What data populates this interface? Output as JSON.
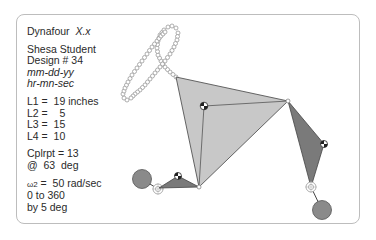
{
  "header": {
    "app_name": "Dynafour",
    "version": "X.x"
  },
  "student": {
    "name": "Shesa Student",
    "design": "Design # 34",
    "date": "mm-dd-yy",
    "time": "hr-mn-sec"
  },
  "links": {
    "l1": "L1 =  19 inches",
    "l2": "L2 =    5",
    "l3": "L3 =  15",
    "l4": "L4 =  10"
  },
  "coupler": {
    "point": "Cplrpt = 13",
    "angle": "@  63  deg"
  },
  "input": {
    "omega_symbol": "ω2",
    "omega": " =  50 rad/sec",
    "range": "0 to 360",
    "step": "by 5 deg"
  },
  "colors": {
    "coupler_fill": "#c8c8c8",
    "link_fill": "#7a7a7a",
    "counterweight_fill": "#8a8a8a",
    "outline": "#444444",
    "curve_stroke": "#9a9a9a",
    "frame_border": "#bdbdbd"
  }
}
